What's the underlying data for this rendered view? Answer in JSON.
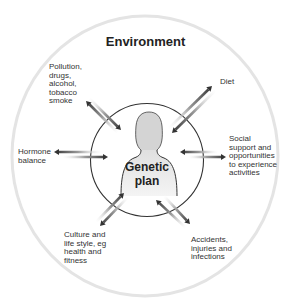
{
  "diagram": {
    "title": "Environment",
    "center_label": "Genetic\nplan",
    "center_figure": "person-silhouette-icon",
    "factors": [
      {
        "id": "pollution",
        "label": "Pollution,\ndrugs,\nalcohol,\ntobacco\nsmoke",
        "arrows": "bidirectional"
      },
      {
        "id": "diet",
        "label": "Diet",
        "arrows": "bidirectional"
      },
      {
        "id": "hormone",
        "label": "Hormone\nbalance",
        "arrows": "bidirectional"
      },
      {
        "id": "social",
        "label": "Social\nsupport and\nopportunities\nto experience\nactivities",
        "arrows": "bidirectional"
      },
      {
        "id": "culture",
        "label": "Culture and\nlife style, eg\nhealth and\nfitness",
        "arrows": "bidirectional"
      },
      {
        "id": "accidents",
        "label": "Accidents,\ninjuries and\ninfections",
        "arrows": "bidirectional"
      }
    ],
    "colors": {
      "outer_ring": "#e6e6e6",
      "inner_ring": "#333333",
      "arrow_dark": "#333333",
      "figure_fill": "#d9d9d9",
      "text": "#333333"
    }
  }
}
